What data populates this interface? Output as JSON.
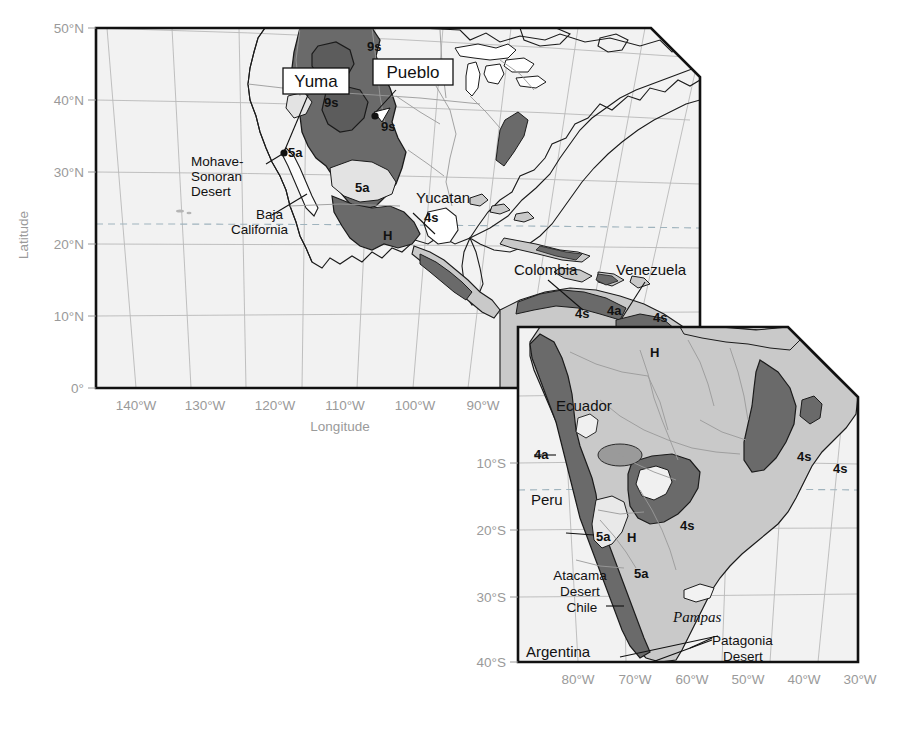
{
  "figure": {
    "type": "thematic-map",
    "projection": "conic",
    "background_color": "#ffffff"
  },
  "colors": {
    "ocean": "#f2f2f2",
    "land_light": "#fbfbfb",
    "land_mid": "#c9c9c9",
    "zone_dark": "#6a6a6a",
    "zone_darker": "#5c5c5c",
    "zone_pale": "#e3e3e3",
    "graticule": "#b9b9b9",
    "tropic_line": "#9fb3bd",
    "frame": "#111111",
    "axis_text": "#9a9a9a",
    "label_text": "#111111"
  },
  "panels": [
    {
      "id": "north-america",
      "name": "North America panel",
      "x_axis": {
        "label": "Longitude",
        "ticks": [
          "140°W",
          "130°W",
          "120°W",
          "110°W",
          "100°W",
          "90°W"
        ],
        "position": "bottom"
      },
      "y_axis": {
        "label": "Latitude",
        "ticks": [
          "50°N",
          "40°N",
          "30°N",
          "20°N",
          "10°N",
          "0°"
        ],
        "position": "left"
      }
    },
    {
      "id": "south-america",
      "name": "South America panel",
      "x_axis": {
        "label": "",
        "ticks": [
          "80°W",
          "70°W",
          "60°W",
          "50°W",
          "40°W",
          "30°W"
        ],
        "position": "bottom"
      },
      "y_axis": {
        "label": "",
        "ticks": [
          "10°S",
          "20°S",
          "30°S",
          "40°S"
        ],
        "position": "left"
      }
    }
  ],
  "callouts": [
    {
      "id": "yuma",
      "label": "Yuma",
      "boxed": true
    },
    {
      "id": "pueblo",
      "label": "Pueblo",
      "boxed": true
    }
  ],
  "city_markers": [
    {
      "id": "yuma-marker",
      "label": "Yuma"
    },
    {
      "id": "pueblo-marker",
      "label": "Pueblo"
    }
  ],
  "place_labels": [
    {
      "id": "mohave-sonoran-desert",
      "lines": [
        "Mohave-",
        "Sonoran",
        "Desert"
      ],
      "style": "plain",
      "leader": true
    },
    {
      "id": "baja-california",
      "lines": [
        "Baja",
        "California"
      ],
      "style": "plain",
      "leader": true
    },
    {
      "id": "yucatan",
      "lines": [
        "Yucatan"
      ],
      "style": "plain",
      "leader": true
    },
    {
      "id": "colombia",
      "lines": [
        "Colombia"
      ],
      "style": "plain",
      "leader": true
    },
    {
      "id": "venezuela",
      "lines": [
        "Venezuela"
      ],
      "style": "plain",
      "leader": true
    },
    {
      "id": "ecuador",
      "lines": [
        "Ecuador"
      ],
      "style": "plain",
      "leader": false
    },
    {
      "id": "peru",
      "lines": [
        "Peru"
      ],
      "style": "plain",
      "leader": false
    },
    {
      "id": "atacama-desert-chile",
      "lines": [
        "Atacama",
        "Desert",
        "Chile"
      ],
      "style": "plain",
      "leader": true
    },
    {
      "id": "argentina",
      "lines": [
        "Argentina"
      ],
      "style": "plain",
      "leader": false
    },
    {
      "id": "pampas",
      "lines": [
        "Pampas"
      ],
      "style": "italic-serif",
      "leader": false
    },
    {
      "id": "patagonia-desert",
      "lines": [
        "Patagonia",
        "Desert"
      ],
      "style": "plain",
      "leader": true
    }
  ],
  "zone_codes": [
    {
      "id": "zone-9s-north",
      "code": "9s",
      "region": "northern-rockies"
    },
    {
      "id": "zone-9s-great-basin",
      "code": "9s",
      "region": "great-basin"
    },
    {
      "id": "zone-9s-colorado",
      "code": "9s",
      "region": "colorado-plateau"
    },
    {
      "id": "zone-5a-mohave",
      "code": "5a",
      "region": "mohave"
    },
    {
      "id": "zone-5a-mexico-north",
      "code": "5a",
      "region": "northern-mexico"
    },
    {
      "id": "zone-4s-yucatan",
      "code": "4s",
      "region": "yucatan-approach"
    },
    {
      "id": "zone-h-mexico",
      "code": "H",
      "region": "mexican-highlands"
    },
    {
      "id": "zone-4s-colombia",
      "code": "4s",
      "region": "caribbean-colombia"
    },
    {
      "id": "zone-4a-venezuela-coast",
      "code": "4a",
      "region": "venezuela-coast"
    },
    {
      "id": "zone-4s-venezuela",
      "code": "4s",
      "region": "venezuela-interior"
    },
    {
      "id": "zone-h-venezuela",
      "code": "H",
      "region": "guiana-highlands"
    },
    {
      "id": "zone-4a-peru-north",
      "code": "4a",
      "region": "northern-peru-coast"
    },
    {
      "id": "zone-5a-peru",
      "code": "5a",
      "region": "peru-coast"
    },
    {
      "id": "zone-h-andes",
      "code": "H",
      "region": "central-andes"
    },
    {
      "id": "zone-4s-chaco",
      "code": "4s",
      "region": "gran-chaco"
    },
    {
      "id": "zone-5a-atacama",
      "code": "5a",
      "region": "atacama"
    },
    {
      "id": "zone-4s-ne-brazil",
      "code": "4s",
      "region": "northeast-brazil"
    },
    {
      "id": "zone-4s-ne-brazil-coast",
      "code": "4s",
      "region": "northeast-brazil-coast"
    }
  ]
}
